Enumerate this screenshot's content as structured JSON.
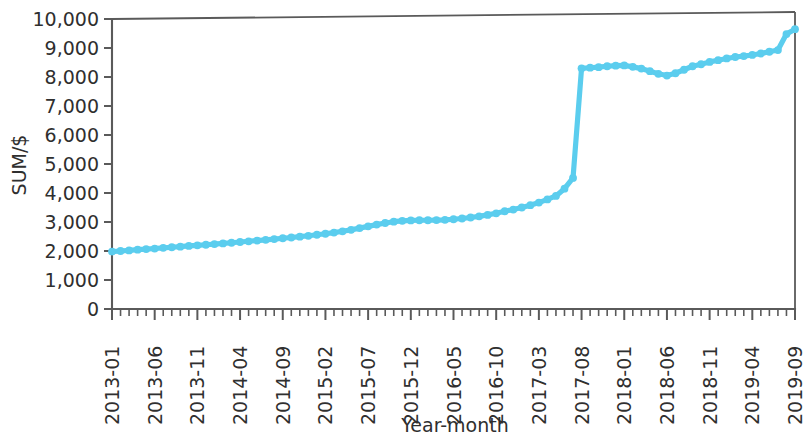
{
  "chart_data": {
    "type": "line",
    "title": "",
    "xlabel": "Year-month",
    "ylabel": "SUM/$",
    "ylim": [
      0,
      10000
    ],
    "ytick_labels": [
      "0",
      "1,000",
      "2,000",
      "3,000",
      "4,000",
      "5,000",
      "6,000",
      "7,000",
      "8,000",
      "9,000",
      "10,000"
    ],
    "ytick_values": [
      0,
      1000,
      2000,
      3000,
      4000,
      5000,
      6000,
      7000,
      8000,
      9000,
      10000
    ],
    "xtick_labels": [
      "2013-01",
      "2013-06",
      "2013-11",
      "2014-04",
      "2014-09",
      "2015-02",
      "2015-07",
      "2015-12",
      "2016-05",
      "2016-10",
      "2017-03",
      "2017-08",
      "2018-01",
      "2018-06",
      "2018-11",
      "2019-04",
      "2019-09"
    ],
    "xtick_label_interval": 5,
    "grid": false,
    "legend": false,
    "marker": "circle",
    "series_color": "#5bcdee",
    "x": [
      "2013-01",
      "2013-02",
      "2013-03",
      "2013-04",
      "2013-05",
      "2013-06",
      "2013-07",
      "2013-08",
      "2013-09",
      "2013-10",
      "2013-11",
      "2013-12",
      "2014-01",
      "2014-02",
      "2014-03",
      "2014-04",
      "2014-05",
      "2014-06",
      "2014-07",
      "2014-08",
      "2014-09",
      "2014-10",
      "2014-11",
      "2014-12",
      "2015-01",
      "2015-02",
      "2015-03",
      "2015-04",
      "2015-05",
      "2015-06",
      "2015-07",
      "2015-08",
      "2015-09",
      "2015-10",
      "2015-11",
      "2015-12",
      "2016-01",
      "2016-02",
      "2016-03",
      "2016-04",
      "2016-05",
      "2016-06",
      "2016-07",
      "2016-08",
      "2016-09",
      "2016-10",
      "2016-11",
      "2016-12",
      "2017-01",
      "2017-02",
      "2017-03",
      "2017-04",
      "2017-05",
      "2017-06",
      "2017-07",
      "2017-08",
      "2017-09",
      "2017-10",
      "2017-11",
      "2017-12",
      "2018-01",
      "2018-02",
      "2018-03",
      "2018-04",
      "2018-05",
      "2018-06",
      "2018-07",
      "2018-08",
      "2018-09",
      "2018-10",
      "2018-11",
      "2018-12",
      "2019-01",
      "2019-02",
      "2019-03",
      "2019-04",
      "2019-05",
      "2019-06",
      "2019-07",
      "2019-08",
      "2019-09"
    ],
    "series": [
      {
        "name": "SUM",
        "values": [
          1980,
          2000,
          2020,
          2045,
          2065,
          2085,
          2110,
          2130,
          2150,
          2175,
          2195,
          2215,
          2240,
          2260,
          2285,
          2310,
          2335,
          2360,
          2385,
          2410,
          2440,
          2465,
          2495,
          2525,
          2560,
          2595,
          2635,
          2680,
          2730,
          2790,
          2850,
          2910,
          2965,
          3010,
          3040,
          3055,
          3060,
          3060,
          3065,
          3075,
          3095,
          3120,
          3155,
          3195,
          3245,
          3300,
          3370,
          3430,
          3500,
          3580,
          3670,
          3780,
          3900,
          4150,
          4520,
          8300,
          8320,
          8340,
          8370,
          8390,
          8400,
          8350,
          8290,
          8200,
          8110,
          8050,
          8130,
          8250,
          8370,
          8440,
          8520,
          8580,
          8640,
          8690,
          8720,
          8760,
          8810,
          8870,
          8930,
          9480,
          9650
        ]
      }
    ]
  },
  "annotations": {
    "jump_month": "2017-08",
    "jump_from": 4520,
    "jump_to": 8300
  }
}
